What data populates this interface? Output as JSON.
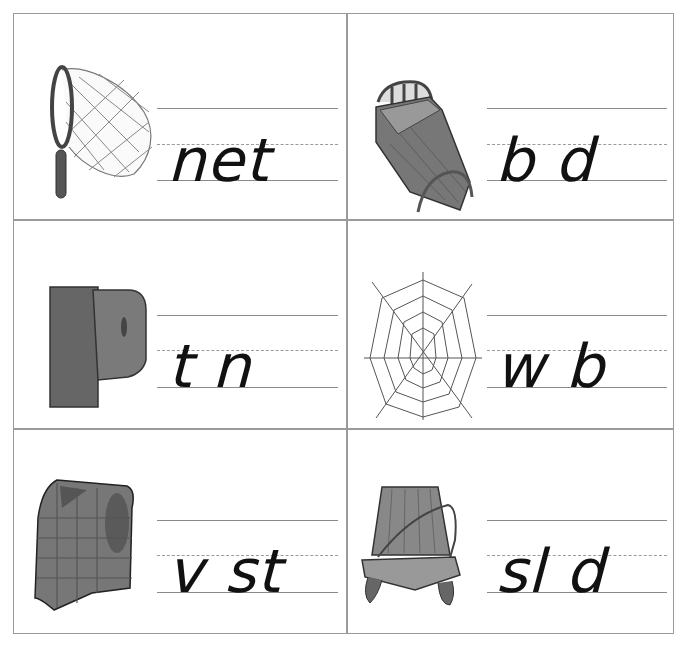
{
  "worksheet": {
    "cells": [
      {
        "picture": "butterfly-net",
        "word": "net",
        "missing_letter_positions": []
      },
      {
        "picture": "bed",
        "word": "b d",
        "missing_letter_positions": [
          1
        ]
      },
      {
        "picture": "peg-letter-p",
        "word": "t n",
        "missing_letter_positions": [
          1
        ]
      },
      {
        "picture": "spider-web",
        "word": "w b",
        "missing_letter_positions": [
          1
        ]
      },
      {
        "picture": "vest",
        "word": "v st",
        "missing_letter_positions": [
          1
        ]
      },
      {
        "picture": "sled",
        "word": "sl d",
        "missing_letter_positions": [
          2
        ]
      }
    ]
  },
  "colors": {
    "border": "#9a9a9a",
    "rule": "#8a8a8a",
    "ink": "#111111"
  }
}
